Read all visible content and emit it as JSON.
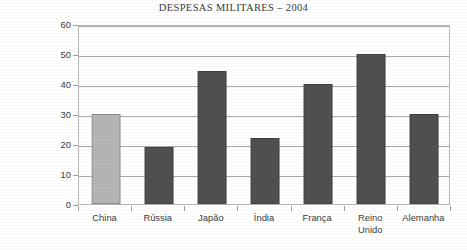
{
  "chart_data": {
    "type": "bar",
    "title": "DESPESAS MILITARES – 2004",
    "xlabel": "",
    "ylabel": "milhares de milhões de US$",
    "categories": [
      "China",
      "Rússia",
      "Japão",
      "Índia",
      "França",
      "Reino Unido",
      "Alemanha"
    ],
    "category_lines": [
      [
        "China"
      ],
      [
        "Rússia"
      ],
      [
        "Japão"
      ],
      [
        "Índia"
      ],
      [
        "França"
      ],
      [
        "Reino",
        "Unido"
      ],
      [
        "Alemanha"
      ]
    ],
    "values": [
      30,
      19,
      44.5,
      22,
      40,
      50,
      30
    ],
    "ylim": [
      0,
      60
    ],
    "ytick_step": 10,
    "yticks": [
      0,
      10,
      20,
      30,
      40,
      50,
      60
    ],
    "ytick_labels": [
      "0",
      "10",
      "20",
      "30",
      "40",
      "50",
      "60"
    ],
    "grid": true,
    "grid_axis": "y",
    "legend": false,
    "bar_colors": [
      "#b5b5b5",
      "#505050",
      "#505050",
      "#505050",
      "#505050",
      "#505050",
      "#505050"
    ],
    "highlighted_category": "China",
    "colors": {
      "bar_dark": "#505050",
      "bar_light": "#b5b5b5",
      "gridline": "#a8a8a8",
      "frame": "#b9b9b9",
      "text": "#3d3d3d",
      "background": "#ffffff"
    }
  }
}
